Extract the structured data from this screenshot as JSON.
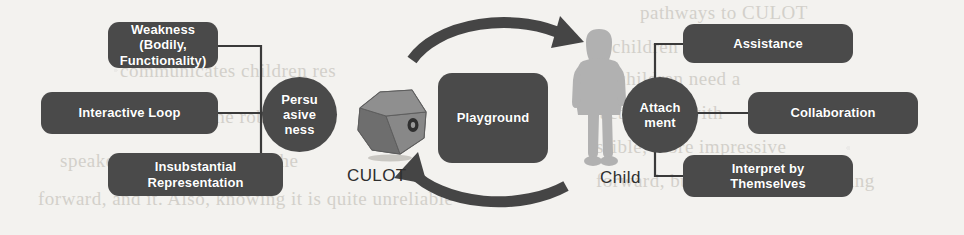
{
  "diagram": {
    "colors": {
      "node_fill": "#4a4a4a",
      "node_text": "#ffffff",
      "connector": "#3a3a3a",
      "arrow": "#454545",
      "robot_body": "#7d7d7d",
      "robot_shade": "#6a6a6a",
      "child_silhouette": "#b0b0b0",
      "background": "#f3f2ef"
    },
    "left_cluster": {
      "hub_label": "Persu\nasive\nness",
      "hub_lines": [
        "Persu",
        "asive",
        "ness"
      ],
      "items": [
        {
          "id": "weakness",
          "lines": [
            "Weakness (Bodily,",
            "Functionality)"
          ]
        },
        {
          "id": "interactive-loop",
          "lines": [
            "Interactive Loop"
          ]
        },
        {
          "id": "insubstantial-representation",
          "lines": [
            "Insubstantial",
            "Representation"
          ]
        }
      ]
    },
    "right_cluster": {
      "hub_lines": [
        "Attach",
        "ment"
      ],
      "items": [
        {
          "id": "assistance",
          "lines": [
            "Assistance"
          ]
        },
        {
          "id": "collaboration",
          "lines": [
            "Collaboration"
          ]
        },
        {
          "id": "interpret-by-themselves",
          "lines": [
            "Interpret by",
            "Themselves"
          ]
        }
      ]
    },
    "center": {
      "playground_label": "Playground",
      "robot_label": "CULOT",
      "child_label": "Child"
    },
    "background_text": {
      "lines": [
        {
          "text": "pathways to CULOT",
          "x": 640,
          "y": 4
        },
        {
          "text": "children cared",
          "x": 612,
          "y": 38
        },
        {
          "text": "communicates children res",
          "x": 120,
          "y": 62
        },
        {
          "text": "o children need a",
          "x": 602,
          "y": 70
        },
        {
          "text": "to body to and the robot is",
          "x": 88,
          "y": 108
        },
        {
          "text": "act and be with",
          "x": 600,
          "y": 104
        },
        {
          "text": "speaker's attitudes toward the",
          "x": 60,
          "y": 152
        },
        {
          "text": "ssible, more impressive",
          "x": 596,
          "y": 138
        },
        {
          "text": "forward, and it. Also, knowing it is quite unreliable",
          "x": 38,
          "y": 190
        },
        {
          "text": "forward, but and it. Also, knowing",
          "x": 596,
          "y": 172
        }
      ]
    }
  }
}
